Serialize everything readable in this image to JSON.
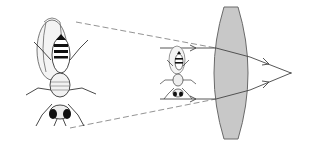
{
  "diagram": {
    "type": "optics-magnification",
    "colors": {
      "background": "#ffffff",
      "lens_fill": "#c8c8c8",
      "lens_stroke": "#6a6a6a",
      "ray": "#444444",
      "dashed_line": "#777777",
      "insect": "#1a1a1a"
    },
    "elements": {
      "large_fly": {
        "label": "",
        "center": [
          52,
          70
        ]
      },
      "small_fly": {
        "label": "",
        "center": [
          177,
          73
        ]
      },
      "lens": {
        "label": "",
        "center": [
          232,
          73
        ]
      },
      "focal_point": {
        "label": "",
        "position": [
          291,
          73
        ]
      }
    }
  }
}
